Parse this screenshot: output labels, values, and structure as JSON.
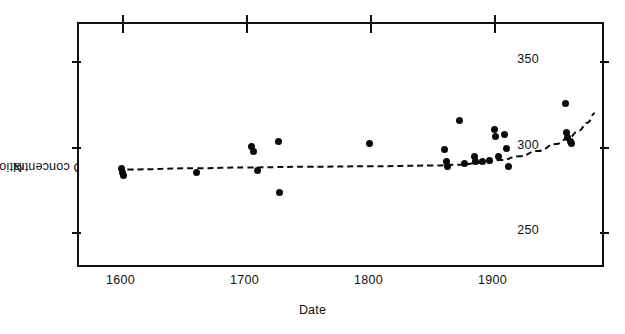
{
  "figure": {
    "background": "#ffffff",
    "ink_color": "#0a0a0a"
  },
  "chart_data": {
    "type": "scatter",
    "title": "",
    "subtitle": "",
    "xlabel": "Date",
    "ylabel": "N2O concentration (ppbv)",
    "ylabel_rich": {
      "prefix": "N",
      "sub": "2",
      "suffix": "O concentration (ppbv)"
    },
    "xlim": [
      1565,
      1990
    ],
    "ylim": [
      228,
      372
    ],
    "xticks": [
      1600,
      1700,
      1800,
      1900
    ],
    "xticklabels": [
      "1600",
      "1700",
      "1800",
      "1900"
    ],
    "yticks": [
      250,
      300,
      350
    ],
    "yticklabels": [
      "250",
      "300",
      "350"
    ],
    "grid": false,
    "legend": false,
    "legend_position": "none",
    "frame": "box",
    "ticks_both_sides": true,
    "marker": "filled-circle",
    "marker_size_px": 7,
    "series": [
      {
        "name": "N2O ice-core measurements",
        "marker": "filled-circle",
        "points": [
          {
            "x": 1599,
            "y": 287
          },
          {
            "x": 1600,
            "y": 285
          },
          {
            "x": 1601,
            "y": 283
          },
          {
            "x": 1660,
            "y": 285
          },
          {
            "x": 1704,
            "y": 300
          },
          {
            "x": 1706,
            "y": 297
          },
          {
            "x": 1709,
            "y": 286
          },
          {
            "x": 1726,
            "y": 303
          },
          {
            "x": 1727,
            "y": 273
          },
          {
            "x": 1799,
            "y": 302
          },
          {
            "x": 1860,
            "y": 298
          },
          {
            "x": 1861,
            "y": 291
          },
          {
            "x": 1862,
            "y": 288
          },
          {
            "x": 1872,
            "y": 315
          },
          {
            "x": 1876,
            "y": 290
          },
          {
            "x": 1884,
            "y": 294
          },
          {
            "x": 1885,
            "y": 291
          },
          {
            "x": 1890,
            "y": 291
          },
          {
            "x": 1896,
            "y": 292
          },
          {
            "x": 1900,
            "y": 310
          },
          {
            "x": 1901,
            "y": 306
          },
          {
            "x": 1903,
            "y": 294
          },
          {
            "x": 1908,
            "y": 307
          },
          {
            "x": 1910,
            "y": 299
          },
          {
            "x": 1911,
            "y": 288
          },
          {
            "x": 1957,
            "y": 325
          },
          {
            "x": 1958,
            "y": 308
          },
          {
            "x": 1959,
            "y": 305
          },
          {
            "x": 1961,
            "y": 303
          },
          {
            "x": 1962,
            "y": 302
          }
        ]
      }
    ],
    "trend_line": {
      "name": "fitted trend",
      "style": "dashed",
      "width_px": 2,
      "points": [
        {
          "x": 1604,
          "y": 286.5
        },
        {
          "x": 1660,
          "y": 287.2
        },
        {
          "x": 1700,
          "y": 287.7
        },
        {
          "x": 1750,
          "y": 288.1
        },
        {
          "x": 1800,
          "y": 288.4
        },
        {
          "x": 1850,
          "y": 288.8
        },
        {
          "x": 1870,
          "y": 289.3
        },
        {
          "x": 1890,
          "y": 290.4
        },
        {
          "x": 1905,
          "y": 292.0
        },
        {
          "x": 1920,
          "y": 294.2
        },
        {
          "x": 1935,
          "y": 297.4
        },
        {
          "x": 1950,
          "y": 301.5
        },
        {
          "x": 1960,
          "y": 305.2
        },
        {
          "x": 1968,
          "y": 309.2
        },
        {
          "x": 1975,
          "y": 314.0
        },
        {
          "x": 1981,
          "y": 319.5
        }
      ]
    }
  }
}
